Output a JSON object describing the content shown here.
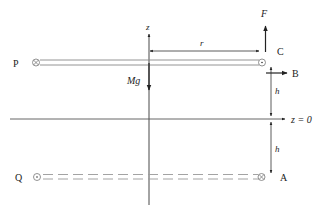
{
  "diagram": {
    "labels": {
      "P": "P",
      "Q": "Q",
      "A": "A",
      "B": "B",
      "C": "C",
      "F": "F",
      "Mg": "Mg",
      "r": "r",
      "z": "z",
      "h_upper": "h",
      "h_lower": "h",
      "z0": "z = 0"
    },
    "markers": {
      "P": "into-page",
      "C": "out-of-page",
      "Q": "out-of-page",
      "A": "into-page"
    },
    "colors": {
      "line": "#333333",
      "rod": "#888888",
      "background": "#ffffff"
    }
  }
}
